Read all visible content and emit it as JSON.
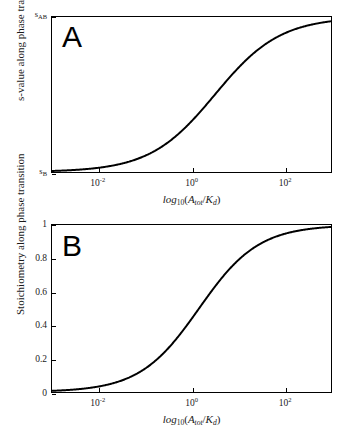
{
  "figure": {
    "background_color": "#ffffff",
    "curve_color": "#000000",
    "axis_color": "#000000"
  },
  "panels": [
    {
      "letter": "A",
      "xaxis_title_parts": {
        "log": "log",
        "base": "10",
        "open": "(",
        "numerator": "A",
        "numerator_sub": "tot",
        "slash": "/",
        "denominator": "K",
        "denominator_sub": "d",
        "close": ")"
      },
      "yaxis_title": "s-value along phase transition",
      "xticklabels": [
        {
          "mantissa": "10",
          "exponent": "-2"
        },
        {
          "mantissa": "10",
          "exponent": "0"
        },
        {
          "mantissa": "10",
          "exponent": "2"
        }
      ],
      "yticklabels": [
        {
          "symbol": "s",
          "sub": "AB"
        },
        {
          "symbol": "s",
          "sub": "B"
        }
      ]
    },
    {
      "letter": "B",
      "xaxis_title_parts": {
        "log": "log",
        "base": "10",
        "open": "(",
        "numerator": "A",
        "numerator_sub": "tot",
        "slash": "/",
        "denominator": "K",
        "denominator_sub": "d",
        "close": ")"
      },
      "yaxis_title": "Stoichiometry along phase transition",
      "xticklabels": [
        {
          "mantissa": "10",
          "exponent": "-2"
        },
        {
          "mantissa": "10",
          "exponent": "0"
        },
        {
          "mantissa": "10",
          "exponent": "2"
        }
      ],
      "yticklabels": [
        "1",
        "0.8",
        "0.6",
        "0.4",
        "0.2",
        "0"
      ]
    }
  ],
  "chart_data": [
    {
      "type": "line",
      "panel": "A",
      "title": "",
      "xlabel": "log10(A_tot/K_d)",
      "ylabel": "s-value along phase transition",
      "xscale": "log",
      "xlim": [
        0.001,
        1000
      ],
      "ylim": [
        0,
        1
      ],
      "ytick_values": [
        0,
        1
      ],
      "ytick_labels": [
        "s_B",
        "s_AB"
      ],
      "xtick_values": [
        0.01,
        1,
        100
      ],
      "xtick_labels": [
        "10^-2",
        "10^0",
        "10^2"
      ],
      "grid": false,
      "legend": null,
      "series": [
        {
          "name": "s-value",
          "model": "hill",
          "hill_n": 0.62,
          "hill_k": 3.2,
          "y_min": 0.0,
          "y_max": 1.0,
          "x": [
            0.001,
            0.00158,
            0.00251,
            0.00398,
            0.00631,
            0.01,
            0.0158,
            0.0251,
            0.0398,
            0.0631,
            0.1,
            0.158,
            0.251,
            0.398,
            0.631,
            1.0,
            1.58,
            2.51,
            3.98,
            6.31,
            10.0,
            15.8,
            25.1,
            39.8,
            63.1,
            100.0,
            158.0,
            251.0,
            398.0,
            631.0,
            1000.0
          ],
          "y": [
            0.009,
            0.012,
            0.016,
            0.021,
            0.027,
            0.035,
            0.045,
            0.058,
            0.074,
            0.095,
            0.121,
            0.152,
            0.191,
            0.236,
            0.289,
            0.349,
            0.415,
            0.484,
            0.554,
            0.623,
            0.688,
            0.746,
            0.797,
            0.84,
            0.875,
            0.903,
            0.926,
            0.943,
            0.957,
            0.967,
            0.975
          ]
        }
      ]
    },
    {
      "type": "line",
      "panel": "B",
      "title": "",
      "xlabel": "log10(A_tot/K_d)",
      "ylabel": "Stoichiometry along phase transition",
      "xscale": "log",
      "xlim": [
        0.001,
        1000
      ],
      "ylim": [
        0,
        1
      ],
      "ytick_values": [
        0,
        0.2,
        0.4,
        0.6,
        0.8,
        1
      ],
      "ytick_labels": [
        "0",
        "0.2",
        "0.4",
        "0.6",
        "0.8",
        "1"
      ],
      "xtick_values": [
        0.01,
        1,
        100
      ],
      "xtick_labels": [
        "10^-2",
        "10^0",
        "10^2"
      ],
      "grid": false,
      "legend": null,
      "series": [
        {
          "name": "stoichiometry",
          "model": "hill",
          "hill_n": 0.68,
          "hill_k": 1.45,
          "y_min": 0.0,
          "y_max": 1.0,
          "x": [
            0.001,
            0.00158,
            0.00251,
            0.00398,
            0.00631,
            0.01,
            0.0158,
            0.0251,
            0.0398,
            0.0631,
            0.1,
            0.158,
            0.251,
            0.398,
            0.631,
            1.0,
            1.58,
            2.51,
            3.98,
            6.31,
            10.0,
            15.8,
            25.1,
            39.8,
            63.1,
            100.0,
            158.0,
            251.0,
            398.0,
            631.0,
            1000.0
          ],
          "y": [
            0.004,
            0.006,
            0.009,
            0.013,
            0.019,
            0.027,
            0.038,
            0.053,
            0.073,
            0.099,
            0.132,
            0.173,
            0.223,
            0.283,
            0.351,
            0.425,
            0.502,
            0.578,
            0.65,
            0.714,
            0.77,
            0.816,
            0.854,
            0.884,
            0.908,
            0.927,
            0.942,
            0.953,
            0.962,
            0.969,
            0.974
          ]
        }
      ]
    }
  ]
}
